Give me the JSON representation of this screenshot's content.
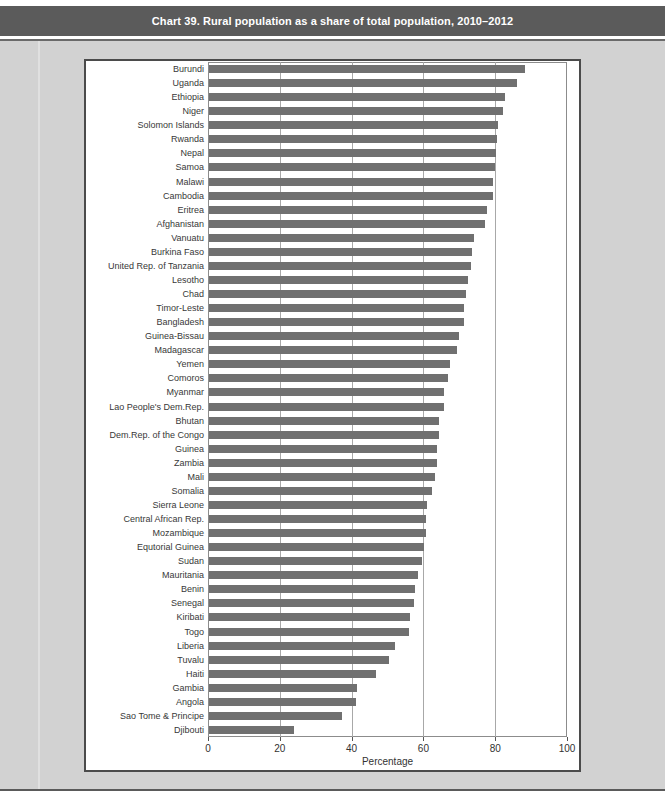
{
  "page": {
    "title": "Chart 39. Rural population as a share of total population, 2010–2012"
  },
  "colors": {
    "title_bar_bg": "#5b5b5b",
    "title_text": "#ffffff",
    "page_bg": "#d2d2d2",
    "panel_bg": "#ffffff",
    "panel_border": "#4b4b4b",
    "bar": "#707070",
    "gridline": "#a8a8a8"
  },
  "chart_data": {
    "type": "bar",
    "orientation": "horizontal",
    "title": "Chart 39. Rural population as a share of total population, 2010–2012",
    "xlabel": "Percentage",
    "xlim": [
      0,
      100
    ],
    "xticks": [
      0,
      20,
      40,
      60,
      80,
      100
    ],
    "grid": true,
    "legend": "none",
    "bar_color": "#707070",
    "categories": [
      "Burundi",
      "Uganda",
      "Ethiopia",
      "Niger",
      "Solomon Islands",
      "Rwanda",
      "Nepal",
      "Samoa",
      "Malawi",
      "Cambodia",
      "Eritrea",
      "Afghanistan",
      "Vanuatu",
      "Burkina Faso",
      "United Rep. of Tanzania",
      "Lesotho",
      "Chad",
      "Timor-Leste",
      "Bangladesh",
      "Guinea-Bissau",
      "Madagascar",
      "Yemen",
      "Comoros",
      "Myanmar",
      "Lao People's Dem.Rep.",
      "Bhutan",
      "Dem.Rep. of the Congo",
      "Guinea",
      "Zambia",
      "Mali",
      "Somalia",
      "Sierra Leone",
      "Central African Rep.",
      "Mozambique",
      "Equtorial Guinea",
      "Sudan",
      "Mauritania",
      "Benin",
      "Senegal",
      "Kiribati",
      "Togo",
      "Liberia",
      "Tuvalu",
      "Haiti",
      "Gambia",
      "Angola",
      "Sao Tome & Principe",
      "Djibouti"
    ],
    "values": [
      88,
      85.7,
      82.4,
      82,
      80.4,
      80.1,
      80,
      79.6,
      79.1,
      79,
      77.4,
      76.9,
      73.7,
      73.2,
      73,
      72.2,
      71.6,
      71.1,
      70.9,
      69.6,
      69,
      67.2,
      66.5,
      65.4,
      65.4,
      64.2,
      64,
      63.5,
      63.5,
      63,
      62,
      60.8,
      60.4,
      60.4,
      60,
      59.2,
      58.2,
      57.4,
      57.1,
      56.1,
      55.8,
      51.8,
      50,
      46.5,
      41.2,
      40.9,
      37,
      23.8
    ]
  }
}
